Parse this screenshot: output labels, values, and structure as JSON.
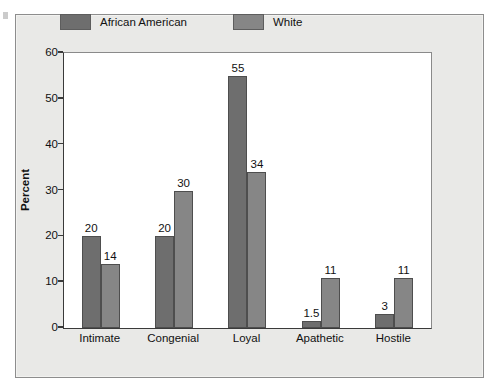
{
  "chart_data": {
    "type": "bar",
    "title": "",
    "xlabel": "",
    "ylabel": "Percent",
    "ylim": [
      0,
      60
    ],
    "yticks": [
      "0",
      "10",
      "20",
      "30",
      "40",
      "50",
      "60"
    ],
    "grid": false,
    "legend_position": "top",
    "categories": [
      "Intimate",
      "Congenial",
      "Loyal",
      "Apathetic",
      "Hostile"
    ],
    "series": [
      {
        "name": "African American",
        "color": "#6e6e6e",
        "values": [
          20,
          20,
          55,
          1.5,
          3
        ],
        "labels": [
          "20",
          "20",
          "55",
          "1.5",
          "3"
        ]
      },
      {
        "name": "White",
        "color": "#868686",
        "values": [
          14,
          30,
          34,
          11,
          11
        ],
        "labels": [
          "14",
          "30",
          "34",
          "11",
          "11"
        ]
      }
    ]
  },
  "legend": {
    "items": [
      {
        "label": "African American",
        "color": "#6e6e6e"
      },
      {
        "label": "White",
        "color": "#868686"
      }
    ]
  },
  "colors": {
    "panel_background": "#e9e9e7",
    "plot_background": "#ffffff",
    "axis": "#3a3a3a",
    "text": "#111111"
  }
}
